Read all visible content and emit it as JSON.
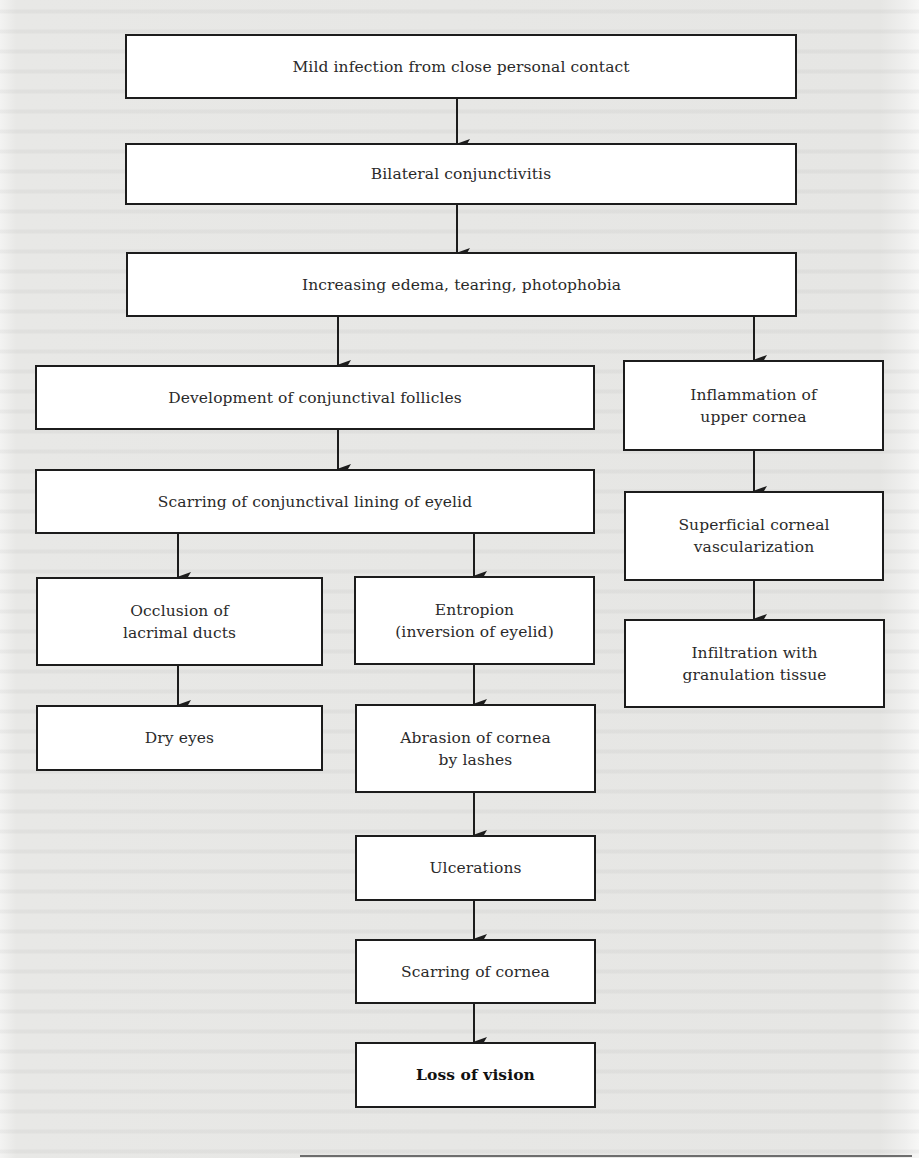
{
  "diagram": {
    "type": "flowchart",
    "topic": "Progression of trachoma to loss of vision",
    "colors": {
      "box_fill": "#ffffff",
      "box_border": "#1c1c1c",
      "text": "#2a2a2a",
      "page_background": "#e9e9e7"
    },
    "nodes": {
      "mild_infection": {
        "label": "Mild infection from close personal contact"
      },
      "bilateral_conjunctivitis": {
        "label": "Bilateral conjunctivitis"
      },
      "increasing_edema": {
        "label": "Increasing edema, tearing, photophobia"
      },
      "conjunctival_follicles": {
        "label": "Development of conjunctival follicles"
      },
      "scarring_lining": {
        "label": "Scarring of conjunctival lining of eyelid"
      },
      "inflammation_upper_cornea": {
        "line1": "Inflammation of",
        "line2": "upper cornea"
      },
      "superficial_vascularization": {
        "line1": "Superficial corneal",
        "line2": "vascularization"
      },
      "infiltration_granulation": {
        "line1": "Infiltration with",
        "line2": "granulation tissue"
      },
      "occlusion_lacrimal": {
        "line1": "Occlusion of",
        "line2": "lacrimal ducts"
      },
      "entropion": {
        "line1": "Entropion",
        "line2": "(inversion of eyelid)"
      },
      "dry_eyes": {
        "label": "Dry eyes"
      },
      "abrasion_cornea": {
        "line1": "Abrasion of cornea",
        "line2": "by lashes"
      },
      "ulcerations": {
        "label": "Ulcerations"
      },
      "scarring_cornea": {
        "label": "Scarring of cornea"
      },
      "loss_of_vision": {
        "label": "Loss of vision"
      }
    },
    "edges": [
      [
        "mild_infection",
        "bilateral_conjunctivitis"
      ],
      [
        "bilateral_conjunctivitis",
        "increasing_edema"
      ],
      [
        "increasing_edema",
        "conjunctival_follicles"
      ],
      [
        "increasing_edema",
        "inflammation_upper_cornea"
      ],
      [
        "conjunctival_follicles",
        "scarring_lining"
      ],
      [
        "scarring_lining",
        "occlusion_lacrimal"
      ],
      [
        "scarring_lining",
        "entropion"
      ],
      [
        "occlusion_lacrimal",
        "dry_eyes"
      ],
      [
        "entropion",
        "abrasion_cornea"
      ],
      [
        "abrasion_cornea",
        "ulcerations"
      ],
      [
        "ulcerations",
        "scarring_cornea"
      ],
      [
        "scarring_cornea",
        "loss_of_vision"
      ],
      [
        "inflammation_upper_cornea",
        "superficial_vascularization"
      ],
      [
        "superficial_vascularization",
        "infiltration_granulation"
      ]
    ]
  }
}
